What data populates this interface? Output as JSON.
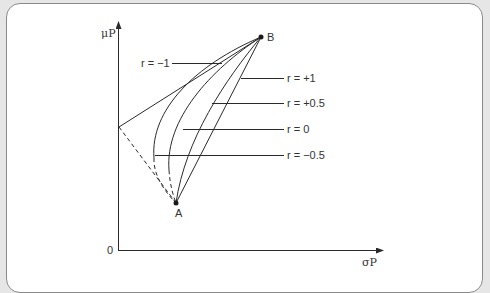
{
  "diagram": {
    "type": "portfolio-risk-return-correlation",
    "axes": {
      "y_label": "μP",
      "x_label": "σP",
      "origin_label": "0"
    },
    "points": {
      "A": {
        "label": "A"
      },
      "B": {
        "label": "B"
      }
    },
    "curves": [
      {
        "id": "r_minus_1",
        "label": "r = −1"
      },
      {
        "id": "r_plus_1",
        "label": "r = +1"
      },
      {
        "id": "r_plus_0_5",
        "label": "r = +0.5"
      },
      {
        "id": "r_0",
        "label": "r = 0"
      },
      {
        "id": "r_minus_0_5",
        "label": "r = −0.5"
      }
    ],
    "colors": {
      "line": "#2a2a2a",
      "background": "#ffffff",
      "frame": "#8a8a8a"
    }
  }
}
